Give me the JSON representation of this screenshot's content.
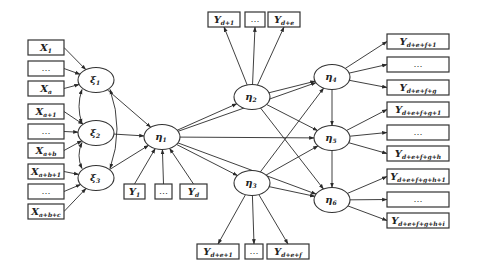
{
  "diagram": {
    "type": "structural-equation-model path diagram",
    "colors": {
      "line": "#2a2a2a",
      "box_border": "#333333",
      "background": "#ffffff"
    },
    "exogenous_indicators": [
      {
        "id": "x1",
        "base": "X",
        "sub": "1",
        "target": "xi1",
        "x": 28,
        "y": 40
      },
      {
        "id": "x2",
        "base": "",
        "sub": "",
        "dots": "…",
        "target": "xi1",
        "x": 28,
        "y": 61
      },
      {
        "id": "x3",
        "base": "X",
        "sub": "a",
        "target": "xi1",
        "x": 28,
        "y": 81
      },
      {
        "id": "x4",
        "base": "X",
        "sub": "a+1",
        "target": "xi2",
        "x": 28,
        "y": 104
      },
      {
        "id": "x5",
        "base": "",
        "sub": "",
        "dots": "…",
        "target": "xi2",
        "x": 28,
        "y": 124
      },
      {
        "id": "x6",
        "base": "X",
        "sub": "a+b",
        "target": "xi2",
        "x": 28,
        "y": 143
      },
      {
        "id": "x7",
        "base": "X",
        "sub": "a+b+1",
        "target": "xi3",
        "x": 28,
        "y": 164
      },
      {
        "id": "x8",
        "base": "",
        "sub": "",
        "dots": "…",
        "target": "xi3",
        "x": 28,
        "y": 184
      },
      {
        "id": "x9",
        "base": "X",
        "sub": "a+b+c",
        "target": "xi3",
        "x": 28,
        "y": 204
      }
    ],
    "latent_exogenous": [
      {
        "id": "xi1",
        "symbol": "ξ",
        "sub": "1",
        "cx": 96,
        "cy": 80
      },
      {
        "id": "xi2",
        "symbol": "ξ",
        "sub": "2",
        "cx": 96,
        "cy": 133
      },
      {
        "id": "xi3",
        "symbol": "ξ",
        "sub": "3",
        "cx": 96,
        "cy": 178
      }
    ],
    "latent_endogenous": [
      {
        "id": "eta1",
        "symbol": "η",
        "sub": "1",
        "cx": 162,
        "cy": 137
      },
      {
        "id": "eta2",
        "symbol": "η",
        "sub": "2",
        "cx": 252,
        "cy": 97
      },
      {
        "id": "eta3",
        "symbol": "η",
        "sub": "3",
        "cx": 252,
        "cy": 183
      },
      {
        "id": "eta4",
        "symbol": "η",
        "sub": "4",
        "cx": 332,
        "cy": 77
      },
      {
        "id": "eta5",
        "symbol": "η",
        "sub": "5",
        "cx": 332,
        "cy": 138
      },
      {
        "id": "eta6",
        "symbol": "η",
        "sub": "6",
        "cx": 332,
        "cy": 200
      }
    ],
    "eta1_indicators": [
      {
        "id": "y1",
        "base": "Y",
        "sub": "1",
        "x": 124,
        "y": 184,
        "w": 21
      },
      {
        "id": "y2",
        "base": "",
        "sub": "",
        "dots": "…",
        "x": 155,
        "y": 184,
        "w": 17
      },
      {
        "id": "yd",
        "base": "Y",
        "sub": "d",
        "x": 180,
        "y": 184,
        "w": 27
      }
    ],
    "eta2_indicators": [
      {
        "id": "yd1",
        "base": "Y",
        "sub": "d+1",
        "x": 208,
        "y": 12,
        "w": 32
      },
      {
        "id": "yd2",
        "base": "",
        "sub": "",
        "dots": "…",
        "x": 245,
        "y": 12,
        "w": 20
      },
      {
        "id": "yde",
        "base": "Y",
        "sub": "d+e",
        "x": 268,
        "y": 12,
        "w": 32
      }
    ],
    "eta3_indicators": [
      {
        "id": "yde1",
        "base": "Y",
        "sub": "d+e+1",
        "x": 197,
        "y": 244,
        "w": 42
      },
      {
        "id": "yde2",
        "base": "",
        "sub": "",
        "dots": "…",
        "x": 245,
        "y": 244,
        "w": 18
      },
      {
        "id": "ydef",
        "base": "Y",
        "sub": "d+e+f",
        "x": 267,
        "y": 244,
        "w": 42
      }
    ],
    "right_indicators": [
      {
        "id": "r1",
        "base": "Y",
        "sub": "d+e+f+1",
        "source": "eta4",
        "x": 387,
        "y": 34
      },
      {
        "id": "r2",
        "base": "",
        "sub": "",
        "dots": "…",
        "source": "eta4",
        "x": 387,
        "y": 57
      },
      {
        "id": "r3",
        "base": "Y",
        "sub": "d+e+f+g",
        "source": "eta4",
        "x": 387,
        "y": 80
      },
      {
        "id": "r4",
        "base": "Y",
        "sub": "d+e+f+g+1",
        "source": "eta5",
        "x": 387,
        "y": 102
      },
      {
        "id": "r5",
        "base": "",
        "sub": "",
        "dots": "…",
        "source": "eta5",
        "x": 387,
        "y": 125
      },
      {
        "id": "r6",
        "base": "Y",
        "sub": "d+e+f+g+h",
        "source": "eta5",
        "x": 387,
        "y": 146
      },
      {
        "id": "r7",
        "base": "Y",
        "sub": "d+e+f+g+h+1",
        "source": "eta6",
        "x": 387,
        "y": 169
      },
      {
        "id": "r8",
        "base": "",
        "sub": "",
        "dots": "…",
        "source": "eta6",
        "x": 387,
        "y": 192
      },
      {
        "id": "r9",
        "base": "Y",
        "sub": "d+e+f+g+h+i",
        "source": "eta6",
        "x": 387,
        "y": 213
      }
    ],
    "structural_paths": [
      [
        "xi1",
        "eta1"
      ],
      [
        "xi2",
        "eta1"
      ],
      [
        "xi3",
        "eta1"
      ],
      [
        "eta1",
        "eta2"
      ],
      [
        "eta1",
        "eta3"
      ],
      [
        "eta1",
        "eta4"
      ],
      [
        "eta1",
        "eta5"
      ],
      [
        "eta1",
        "eta6"
      ],
      [
        "eta2",
        "eta4"
      ],
      [
        "eta2",
        "eta5"
      ],
      [
        "eta2",
        "eta6"
      ],
      [
        "eta3",
        "eta4"
      ],
      [
        "eta3",
        "eta5"
      ],
      [
        "eta3",
        "eta6"
      ],
      [
        "eta4",
        "eta5"
      ],
      [
        "eta5",
        "eta6"
      ]
    ],
    "covariances": [
      [
        "xi1",
        "xi2"
      ],
      [
        "xi2",
        "xi3"
      ],
      [
        "xi1",
        "xi3"
      ]
    ]
  }
}
